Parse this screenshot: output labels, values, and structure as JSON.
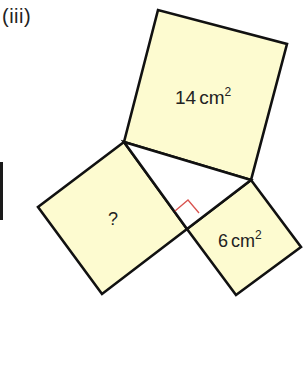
{
  "figure": {
    "part_label": "(iii)",
    "colors": {
      "square_fill": "#fdfbd0",
      "stroke": "#111111",
      "right_angle_marker": "#d9534f",
      "triangle_fill": "#ffffff"
    },
    "triangle": {
      "vertices": {
        "A": [
          124,
          142
        ],
        "B": [
          251,
          180
        ],
        "C_right_angle": [
          187,
          229
        ]
      }
    },
    "squares": [
      {
        "id": "hypotenuse-square",
        "side": "AB",
        "label": "14",
        "unit": "cm",
        "exponent": "2",
        "points": "124,142 158,10 287,44 251,180"
      },
      {
        "id": "unknown-square",
        "side": "AC",
        "label": "?",
        "unit": "",
        "exponent": "",
        "points": "124,142 38,207 102,294 187,229"
      },
      {
        "id": "leg-square",
        "side": "BC",
        "label": "6",
        "unit": "cm",
        "exponent": "2",
        "points": "251,180 301,247 236,295 187,229"
      }
    ],
    "right_angle_marker_points": "175,211 188,200 199,213"
  }
}
